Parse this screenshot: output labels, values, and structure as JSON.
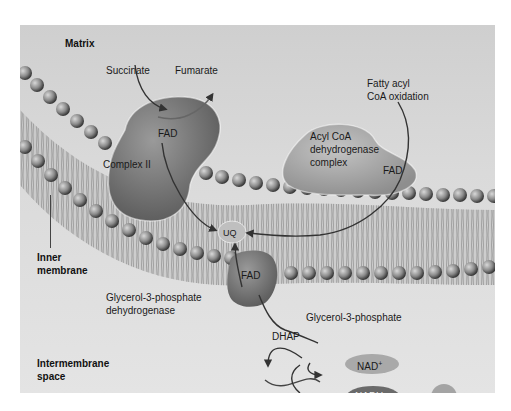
{
  "regions": {
    "matrix": "Matrix",
    "inner_membrane_line1": "Inner",
    "inner_membrane_line2": "membrane",
    "intermembrane_line1": "Intermembrane",
    "intermembrane_line2": "space"
  },
  "complex_ii": {
    "label": "Complex II",
    "substrate": "Succinate",
    "product": "Fumarate",
    "cofactor": "FAD"
  },
  "acyl_coa": {
    "label_line1": "Acyl CoA",
    "label_line2": "dehydrogenase",
    "label_line3": "complex",
    "cofactor": "FAD",
    "source_line1": "Fatty acyl",
    "source_line2": "CoA oxidation"
  },
  "ubiquinone": {
    "label": "UQ"
  },
  "g3p_dehydrogenase": {
    "label_line1": "Glycerol-3-phosphate",
    "label_line2": "dehydrogenase",
    "cofactor": "FAD",
    "substrate": "Glycerol-3-phosphate",
    "product": "DHAP"
  },
  "cytosolic": {
    "nad": "NAD",
    "nad_sup": "+",
    "nadh": "NADH",
    "plus": "+",
    "h": "H",
    "h_sup": "+"
  }
}
